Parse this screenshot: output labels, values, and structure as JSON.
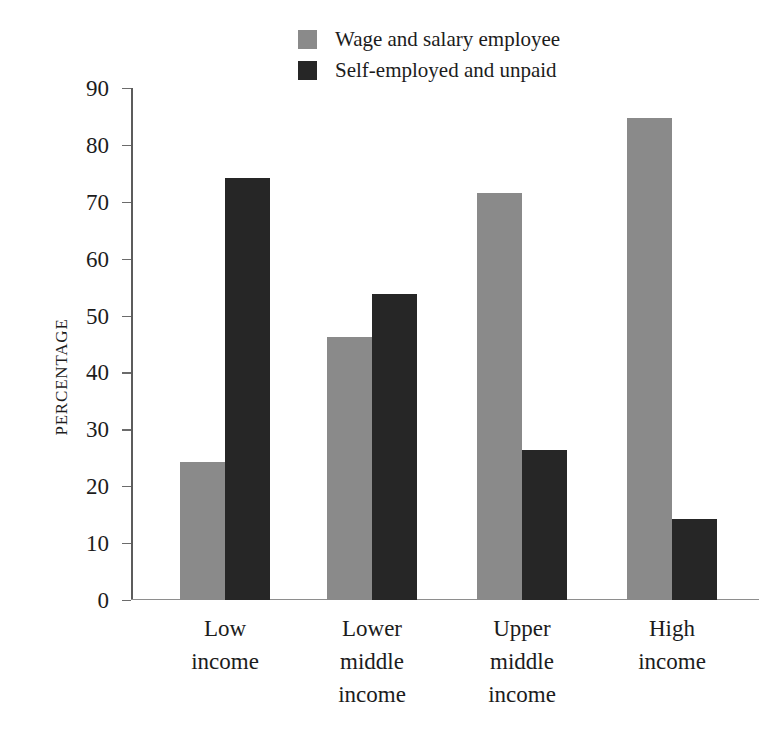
{
  "chart_data": {
    "type": "bar",
    "title": "",
    "xlabel": "",
    "ylabel": "PERCENTAGE",
    "ylim": [
      0,
      90
    ],
    "ytick_step": 10,
    "yticks": [
      0,
      10,
      20,
      30,
      40,
      50,
      60,
      70,
      80,
      90
    ],
    "grid": false,
    "legend_position": "top-center",
    "categories": [
      "Low\nincome",
      "Lower\nmiddle\nincome",
      "Upper\nmiddle\nincome",
      "High\nincome"
    ],
    "series": [
      {
        "name": "Wage and salary employee",
        "color": "#8a8a8a",
        "values": [
          24.3,
          46.2,
          71.5,
          84.7
        ]
      },
      {
        "name": "Self-employed and unpaid",
        "color": "#262626",
        "values": [
          74.2,
          53.8,
          26.4,
          14.2
        ]
      }
    ]
  },
  "legend": {
    "items": [
      {
        "label": "Wage and salary employee",
        "swatch": "legend-swatch-gray"
      },
      {
        "label": "Self-employed and unpaid",
        "swatch": "legend-swatch-dark"
      }
    ]
  },
  "axis": {
    "y_title": "PERCENTAGE",
    "y_tick_labels": [
      "90",
      "80",
      "70",
      "60",
      "50",
      "40",
      "30",
      "20",
      "10",
      "0"
    ]
  },
  "colors": {
    "series_wage": "#8a8a8a",
    "series_self_employed": "#262626",
    "axis": "#5c5c5c",
    "text": "#1c1c1c",
    "background": "#ffffff"
  }
}
